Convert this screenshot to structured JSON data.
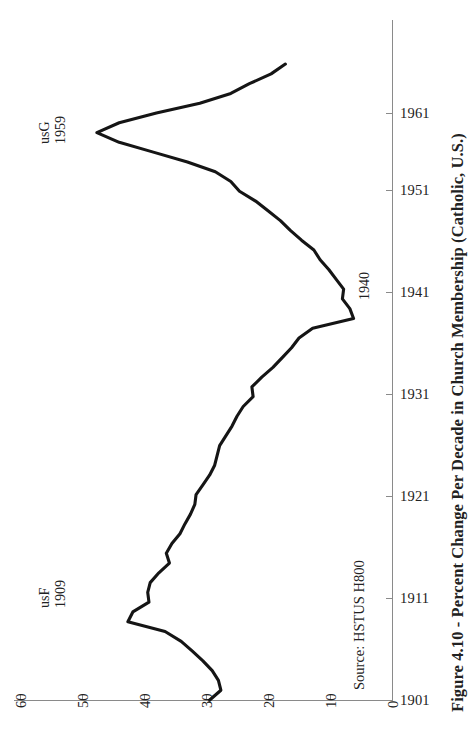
{
  "figure": {
    "title": "Figure 4.10 - Percent Change Per Decade in Church Membership (Catholic, U.S.)",
    "source_note": "Source: HSTUS H800"
  },
  "annotations": {
    "peak_high": {
      "series": "usG",
      "year": "1959"
    },
    "peak_low": {
      "series": "usF",
      "year": "1909"
    },
    "midpoint": {
      "year": "1940"
    }
  },
  "axes": {
    "value_axis_labels": [
      "60",
      "50",
      "40",
      "30",
      "20",
      "10",
      "0"
    ],
    "year_axis_labels": [
      "1901",
      "1911",
      "1921",
      "1931",
      "1941",
      "1951",
      "1961"
    ]
  },
  "chart_data": {
    "type": "line",
    "title": "Figure 4.10 - Percent Change Per Decade in Church Membership (Catholic, U.S.)",
    "orientation": "horizontal-value-axis-reversed",
    "xlabel": "Percent Change Per Decade",
    "ylabel": "Year",
    "xlim": [
      60,
      0
    ],
    "ylim": [
      1901,
      1966
    ],
    "grid": false,
    "legend": null,
    "x": [
      1901,
      1902,
      1903,
      1904,
      1905,
      1906,
      1907,
      1908,
      1909,
      1910,
      1911,
      1912,
      1913,
      1914,
      1915,
      1916,
      1917,
      1918,
      1919,
      1920,
      1921,
      1922,
      1923,
      1924,
      1925,
      1926,
      1927,
      1928,
      1929,
      1930,
      1931,
      1932,
      1933,
      1934,
      1935,
      1936,
      1937,
      1938,
      1939,
      1940,
      1941,
      1942,
      1943,
      1944,
      1945,
      1946,
      1947,
      1948,
      1949,
      1950,
      1951,
      1952,
      1953,
      1954,
      1955,
      1956,
      1957,
      1958,
      1959,
      1960,
      1961,
      1962,
      1963,
      1964,
      1965,
      1966
    ],
    "values": [
      29.4,
      27.6,
      28.0,
      29.0,
      30.5,
      32.2,
      34.0,
      36.6,
      42.6,
      41.8,
      39.2,
      39.4,
      39.0,
      37.6,
      35.9,
      36.4,
      35.5,
      34.2,
      33.4,
      32.5,
      31.8,
      31.6,
      30.5,
      29.4,
      28.6,
      28.2,
      27.8,
      26.8,
      25.8,
      25.0,
      24.0,
      22.4,
      22.6,
      21.0,
      19.2,
      17.7,
      16.2,
      15.0,
      12.8,
      6.2,
      6.8,
      8.0,
      7.8,
      9.0,
      10.2,
      11.6,
      12.6,
      14.6,
      16.4,
      18.0,
      20.0,
      22.0,
      24.6,
      26.0,
      28.5,
      33.0,
      38.5,
      44.0,
      47.6,
      44.0,
      38.0,
      31.0,
      26.0,
      23.0,
      19.5,
      17.2
    ],
    "series_name": "Percent Change Per Decade in Catholic Church Membership (U.S.)",
    "notable_points": [
      {
        "label": "usF",
        "year": 1909,
        "value": 42.6
      },
      {
        "label": "1940",
        "year": 1940,
        "value": 6.2
      },
      {
        "label": "usG",
        "year": 1959,
        "value": 47.6
      }
    ]
  }
}
